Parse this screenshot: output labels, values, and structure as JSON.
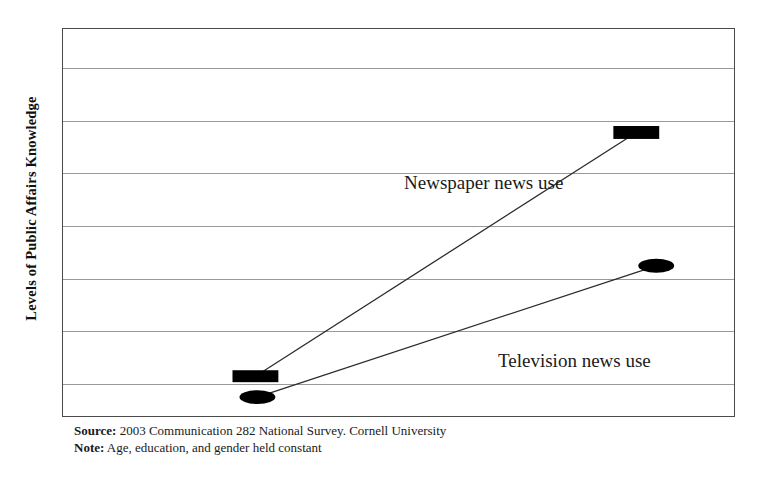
{
  "chart_data": {
    "type": "line",
    "title": "",
    "subtitle": "",
    "xlabel": "",
    "ylabel": "Levels of Public Affairs Knowledge",
    "x": [
      "Low news use",
      "High news use"
    ],
    "grid": true,
    "gridline_count": 7,
    "legend_position": "inline-annotation",
    "series": [
      {
        "name": "Newspaper news use",
        "marker": "rectangle",
        "color": "#000000",
        "values": [
          1.0,
          6.0
        ],
        "points": [
          {
            "x_px": 255,
            "y_px": 377
          },
          {
            "x_px": 637,
            "y_px": 132
          }
        ]
      },
      {
        "name": "Television news use",
        "marker": "ellipse",
        "color": "#000000",
        "values": [
          0.55,
          3.4
        ],
        "points": [
          {
            "x_px": 257,
            "y_px": 398
          },
          {
            "x_px": 657,
            "y_px": 266
          }
        ]
      }
    ],
    "annotations": [
      {
        "text": "Newspaper news use",
        "x_px": 403,
        "y_px": 155
      },
      {
        "text": "Television news use",
        "x_px": 497,
        "y_px": 333
      }
    ],
    "ylim": [
      0,
      8
    ],
    "yticks_labeled": false,
    "xticks_labeled": false
  },
  "axis": {
    "y_title": "Levels of Public Affairs Knowledge"
  },
  "labels": {
    "newspaper": "Newspaper news use",
    "television": "Television news use"
  },
  "footnotes": {
    "source_key": "Source:",
    "source_text": " 2003 Communication 282 National Survey. Cornell University",
    "note_key": "Note:",
    "note_text": " Age, education, and gender held constant"
  },
  "colors": {
    "marker": "#000000",
    "series_line": "#2b2b2b",
    "gridline": "#9a9a9a",
    "frame": "#4a4a4a",
    "background": "#ffffff",
    "text": "#1a1a1a"
  }
}
